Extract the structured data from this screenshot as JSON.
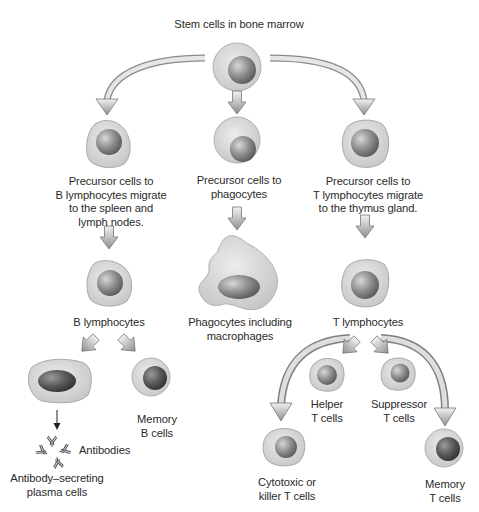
{
  "title": "Stem cells in bone marrow",
  "colors": {
    "cytoplasm": "#d9d9d9",
    "cytoplasm_edge": "#b5b5b5",
    "nucleus_light": "#c9c9c9",
    "nucleus_dark": "#6a6a6a",
    "arrow_fill": "#a9a9a9",
    "arrow_stroke": "#7a7a7a",
    "text": "#2a2a2a"
  },
  "nodes": {
    "stem": {
      "label": "Stem cells in bone marrow",
      "shape": "round-cell"
    },
    "b_precursor": {
      "label": "Precursor cells to\nB lymphocytes migrate\nto the spleen and\nlymph nodes.",
      "shape": "irregular-cell"
    },
    "phago_precursor": {
      "label": "Precursor cells to\nphagocytes",
      "shape": "round-cell"
    },
    "t_precursor": {
      "label": "Precursor cells to\nT lymphocytes migrate\nto the thymus gland.",
      "shape": "irregular-cell"
    },
    "b_lymphocytes": {
      "label": "B lymphocytes",
      "shape": "irregular-cell"
    },
    "phagocytes": {
      "label": "Phagocytes including\nmacrophages",
      "shape": "macrophage"
    },
    "t_lymphocytes": {
      "label": "T lymphocytes",
      "shape": "irregular-cell"
    },
    "plasma_cells": {
      "label": "Antibody–secreting\nplasma cells",
      "shape": "plasma-cell"
    },
    "antibodies": {
      "label": "Antibodies",
      "shape": "y-antibodies"
    },
    "memory_b": {
      "label": "Memory\nB cells",
      "shape": "round-cell"
    },
    "helper_t": {
      "label": "Helper\nT cells",
      "shape": "irregular-cell"
    },
    "suppressor_t": {
      "label": "Suppressor\nT cells",
      "shape": "irregular-cell"
    },
    "cytotoxic_t": {
      "label": "Cytotoxic or\nkiller T cells",
      "shape": "irregular-cell"
    },
    "memory_t": {
      "label": "Memory\nT cells",
      "shape": "round-cell"
    }
  },
  "edges": [
    {
      "from": "stem",
      "to": "b_precursor",
      "style": "curved-arrow"
    },
    {
      "from": "stem",
      "to": "phago_precursor",
      "style": "block-arrow"
    },
    {
      "from": "stem",
      "to": "t_precursor",
      "style": "curved-arrow"
    },
    {
      "from": "b_precursor",
      "to": "b_lymphocytes",
      "style": "block-arrow"
    },
    {
      "from": "phago_precursor",
      "to": "phagocytes",
      "style": "block-arrow"
    },
    {
      "from": "t_precursor",
      "to": "t_lymphocytes",
      "style": "block-arrow"
    },
    {
      "from": "b_lymphocytes",
      "to": "plasma_cells",
      "style": "block-arrow"
    },
    {
      "from": "b_lymphocytes",
      "to": "memory_b",
      "style": "block-arrow"
    },
    {
      "from": "plasma_cells",
      "to": "antibodies",
      "style": "thin-arrow"
    },
    {
      "from": "t_lymphocytes",
      "to": "helper_t",
      "style": "block-arrow"
    },
    {
      "from": "t_lymphocytes",
      "to": "suppressor_t",
      "style": "block-arrow"
    },
    {
      "from": "t_lymphocytes",
      "to": "cytotoxic_t",
      "style": "curved-arrow"
    },
    {
      "from": "t_lymphocytes",
      "to": "memory_t",
      "style": "curved-arrow"
    }
  ]
}
